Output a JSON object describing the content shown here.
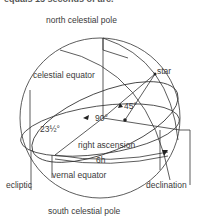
{
  "header": {
    "cropped_text": "equals 15 seconds of arc."
  },
  "labels": {
    "north_pole": "north celestial pole",
    "south_pole": "south celestial pole",
    "celestial_equator": "celestial equator",
    "star": "star",
    "angle_45": "45°",
    "angle_90": "90°",
    "angle_23": "23½°",
    "right_ascension": "right ascension",
    "hours": "6h",
    "ecliptic": "ecliptic",
    "vernal_equator": "vernal equator",
    "declination": "declination"
  },
  "colors": {
    "line": "#333333",
    "text": "#3a3a3a",
    "background": "#ffffff"
  }
}
